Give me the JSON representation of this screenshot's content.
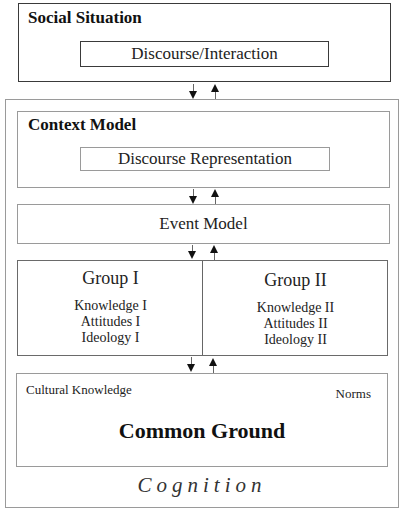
{
  "diagram": {
    "social_situation": {
      "title": "Social Situation",
      "inner": "Discourse/Interaction"
    },
    "cognition": {
      "title": "Cognition",
      "context_model": {
        "title": "Context Model",
        "inner": "Discourse Representation"
      },
      "event_model": {
        "title": "Event Model"
      },
      "groups": [
        {
          "title": "Group I",
          "items": [
            "Knowledge I",
            "Attitudes I",
            "Ideology I"
          ]
        },
        {
          "title": "Group II",
          "items": [
            "Knowledge II",
            "Attitudes II",
            "Ideology II"
          ]
        }
      ],
      "common_ground": {
        "title": "Common Ground",
        "left_label": "Cultural Knowledge",
        "right_label": "Norms"
      }
    },
    "connections": [
      {
        "from": "Social Situation",
        "to": "Context Model",
        "type": "bidirectional"
      },
      {
        "from": "Context Model",
        "to": "Event Model",
        "type": "bidirectional"
      },
      {
        "from": "Event Model",
        "to": "Groups",
        "type": "bidirectional"
      },
      {
        "from": "Groups",
        "to": "Common Ground",
        "type": "bidirectional"
      }
    ]
  }
}
